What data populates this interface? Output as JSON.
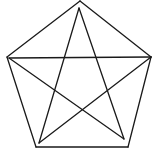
{
  "figure": {
    "stroke_color": "#1a1a1a",
    "background": "#ffffff",
    "pentagon": {
      "vertices": [
        [
          80,
          1
        ],
        [
          151,
          57
        ],
        [
          128,
          147
        ],
        [
          36,
          147
        ],
        [
          7,
          57
        ]
      ]
    },
    "star": {
      "vertices": [
        [
          79,
          8
        ],
        [
          151,
          57
        ],
        [
          124,
          139
        ],
        [
          39,
          143
        ],
        [
          9,
          58
        ]
      ],
      "edges": [
        [
          0,
          2
        ],
        [
          0,
          3
        ],
        [
          4,
          1
        ],
        [
          4,
          2
        ],
        [
          3,
          1
        ]
      ]
    }
  }
}
